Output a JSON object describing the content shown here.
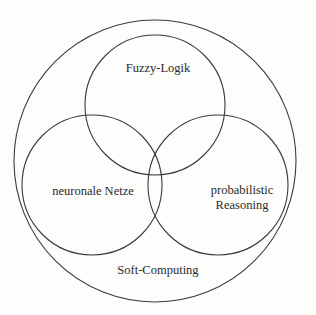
{
  "figure": {
    "type": "venn-diagram",
    "title": "Soft-Computing",
    "background_color": "#fdfdfc",
    "stroke_color": "#3a3a3a",
    "text_color": "#2a2a2a",
    "outer_set": {
      "label": "Soft-Computing",
      "cx": 155,
      "cy": 161,
      "r": 141
    },
    "sets": [
      {
        "id": "fuzzy",
        "label": "Fuzzy-Logik",
        "cx": 155,
        "cy": 105,
        "r": 70
      },
      {
        "id": "neuronale",
        "label": "neuronale Netze",
        "cx": 92,
        "cy": 185,
        "r": 70
      },
      {
        "id": "probabilistic",
        "label_line1": "probabilistic",
        "label_line2": "Reasoning",
        "cx": 218,
        "cy": 185,
        "r": 70
      }
    ]
  },
  "labels": {
    "fuzzy": "Fuzzy-Logik",
    "neuronale": "neuronale Netze",
    "probabilistic_line1": "probabilistic",
    "probabilistic_line2": "Reasoning",
    "soft_computing": "Soft-Computing"
  },
  "bleed_through": {
    "note": "faint show-through from reverse side of page, illegible",
    "rows": [
      "a c c c c c  c c c c c c c c",
      "c c c c c c c c c c c c c",
      "c c c c c c c c c c c c c c",
      "c c c c c c c c c c c c",
      "c c c c c c c c c c c c c"
    ]
  }
}
